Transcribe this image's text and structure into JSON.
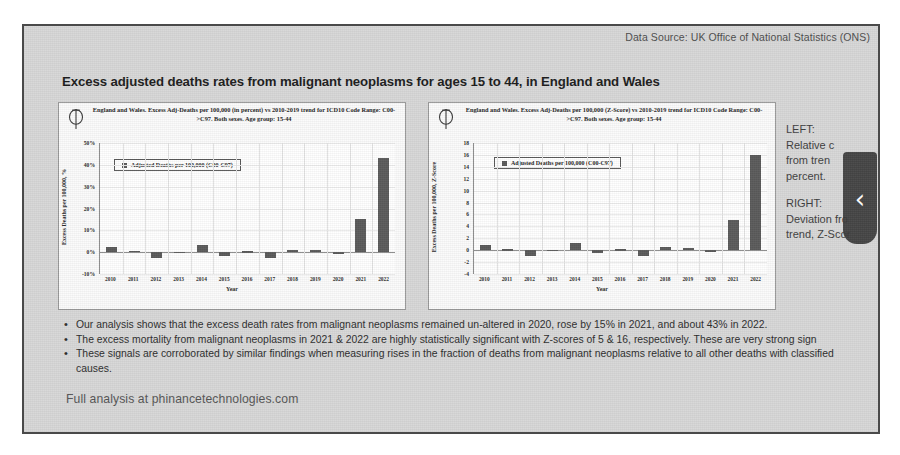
{
  "header": {
    "data_source": "Data Source: UK Office of National Statistics (ONS)"
  },
  "slide": {
    "title": "Excess adjusted deaths rates from malignant neoplasms for ages 15 to 44, in England and Wales",
    "footer": "Full analysis at phinancetechnologies.com"
  },
  "annotations": {
    "left_heading": "LEFT:",
    "left_body": "Relative c\nfrom tren\npercent.",
    "right_heading": "RIGHT:",
    "right_body": "Deviation fro\ntrend, Z-Scor",
    "chevron_glyph": "‹"
  },
  "bullets": [
    "Our analysis shows that the excess death rates from malignant neoplasms remained un-altered in 2020, rose by 15% in 2021, and about 43% in 2022.",
    "The excess mortality from malignant neoplasms in 2021 & 2022 are highly statistically significant with Z-scores of 5 & 16, respectively. These are very strong sign",
    "These signals are corroborated by similar findings when measuring rises in the fraction of deaths from malignant neoplasms relative to all other deaths with classified causes."
  ],
  "chart_data": [
    {
      "id": "left",
      "type": "bar",
      "title": "England and Wales. Excess Adj-Deaths per 100,000 (in percent) vs 2010-2019 trend for ICD10 Code Range: C00->C97. Both sexes. Age group: 15-44",
      "legend": "Adjusted Deaths per 100,000 (C00-C97)",
      "legend_position": "upper-left-inside",
      "xlabel": "Year",
      "ylabel": "Excess Deaths per 100,000, %",
      "categories": [
        "2010",
        "2011",
        "2012",
        "2013",
        "2014",
        "2015",
        "2016",
        "2017",
        "2018",
        "2019",
        "2020",
        "2021",
        "2022"
      ],
      "values": [
        2.2,
        0.6,
        -2.6,
        0.3,
        3.1,
        -1.6,
        0.4,
        -2.5,
        1.2,
        1.1,
        -0.8,
        15.0,
        43.0
      ],
      "ylim": [
        -10,
        50
      ],
      "yticks": [
        "50%",
        "40%",
        "30%",
        "20%",
        "10%",
        "0%",
        "-10%"
      ],
      "ytick_values": [
        50,
        40,
        30,
        20,
        10,
        0,
        -10
      ],
      "grid": true,
      "bar_color": "#5b5b5b"
    },
    {
      "id": "right",
      "type": "bar",
      "title": "England and Wales. Excess Adj-Deaths per 100,000 (Z-Score) vs 2010-2019 trend for ICD10 Code Range: C00->C97. Both sexes. Age group: 15-44",
      "legend": "Adjusted Deaths per 100,000 (C00-C97)",
      "legend_position": "upper-left-inside",
      "xlabel": "Year",
      "ylabel": "Excess Deaths per 100,000, Z-Score",
      "categories": [
        "2010",
        "2011",
        "2012",
        "2013",
        "2014",
        "2015",
        "2016",
        "2017",
        "2018",
        "2019",
        "2020",
        "2021",
        "2022"
      ],
      "values": [
        0.8,
        0.15,
        -1.0,
        0.1,
        1.2,
        -0.5,
        0.2,
        -0.9,
        0.5,
        0.35,
        -0.25,
        5.0,
        16.0
      ],
      "ylim": [
        -4,
        18
      ],
      "yticks": [
        "18",
        "16",
        "14",
        "12",
        "10",
        "8",
        "6",
        "4",
        "2",
        "0",
        "-2",
        "-4"
      ],
      "ytick_values": [
        18,
        16,
        14,
        12,
        10,
        8,
        6,
        4,
        2,
        0,
        -2,
        -4
      ],
      "grid": true,
      "bar_color": "#5b5b5b"
    }
  ]
}
